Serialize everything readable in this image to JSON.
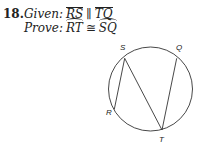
{
  "problem": {
    "number": "18.",
    "given_label": "Given:",
    "given": {
      "left": "RS",
      "relation": "∥",
      "right": "TQ",
      "notation": "segment"
    },
    "prove_label": "Prove:",
    "prove": {
      "left": "RT",
      "relation": "≅",
      "right": "SQ",
      "notation": "arc"
    }
  },
  "figure": {
    "type": "circle-with-chords",
    "circle": {
      "cx": 150.5,
      "cy": 89,
      "r": 42
    },
    "points": {
      "S": {
        "label": "S",
        "x": 124.7,
        "y": 58.3,
        "lx": 120,
        "ly": 50
      },
      "Q": {
        "label": "Q",
        "x": 176.7,
        "y": 58.3,
        "lx": 176,
        "ly": 50
      },
      "R": {
        "label": "R",
        "x": 114.3,
        "y": 109.3,
        "lx": 106,
        "ly": 115
      },
      "T": {
        "label": "T",
        "x": 162,
        "y": 130,
        "lx": 159,
        "ly": 142
      }
    },
    "chords": [
      [
        "R",
        "S"
      ],
      [
        "S",
        "T"
      ],
      [
        "T",
        "Q"
      ]
    ],
    "stroke": "#333333"
  }
}
